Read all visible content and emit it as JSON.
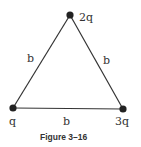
{
  "figure": {
    "caption": "Figure 3–16",
    "vertices": [
      {
        "id": "top",
        "charge": "2q"
      },
      {
        "id": "bottom-left",
        "charge": "q"
      },
      {
        "id": "bottom-right",
        "charge": "3q"
      }
    ],
    "sides": [
      {
        "id": "left",
        "length": "b"
      },
      {
        "id": "right",
        "length": "b"
      },
      {
        "id": "bottom",
        "length": "b"
      }
    ]
  }
}
